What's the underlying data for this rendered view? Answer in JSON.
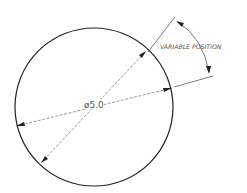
{
  "diagram": {
    "type": "engineering-dimension-drawing",
    "diameter_label": "ø5.0",
    "angle_label": "VARIABLE POSITION",
    "colors": {
      "line": "#222222",
      "dim": "#444444",
      "text": "#555555"
    }
  }
}
